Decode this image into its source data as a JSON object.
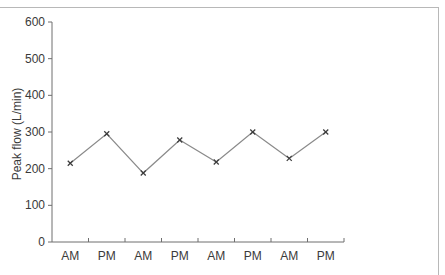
{
  "chart_data": {
    "type": "line",
    "title": "",
    "xlabel": "",
    "ylabel": "Peak flow (L/min)",
    "categories": [
      "AM",
      "PM",
      "AM",
      "PM",
      "AM",
      "PM",
      "AM",
      "PM"
    ],
    "series": [
      {
        "name": "Peak flow",
        "values": [
          215,
          295,
          188,
          278,
          218,
          300,
          228,
          300
        ],
        "marker": "x",
        "color": "#8a8a8a"
      }
    ],
    "ylim": [
      0,
      600
    ],
    "yticks": [
      0,
      100,
      200,
      300,
      400,
      500,
      600
    ],
    "grid": false,
    "legend": "none"
  },
  "axis": {
    "ylabel": "Peak flow (L/min)",
    "ytick_labels": [
      "0",
      "100",
      "200",
      "300",
      "400",
      "500",
      "600"
    ],
    "xtick_labels": [
      "AM",
      "PM",
      "AM",
      "PM",
      "AM",
      "PM",
      "AM",
      "PM"
    ]
  },
  "colors": {
    "axis": "#6e6e6e",
    "line": "#8a8a8a",
    "marker": "#3c3c3c",
    "text": "#3a3a3a",
    "frame": "#b8b8b8"
  }
}
